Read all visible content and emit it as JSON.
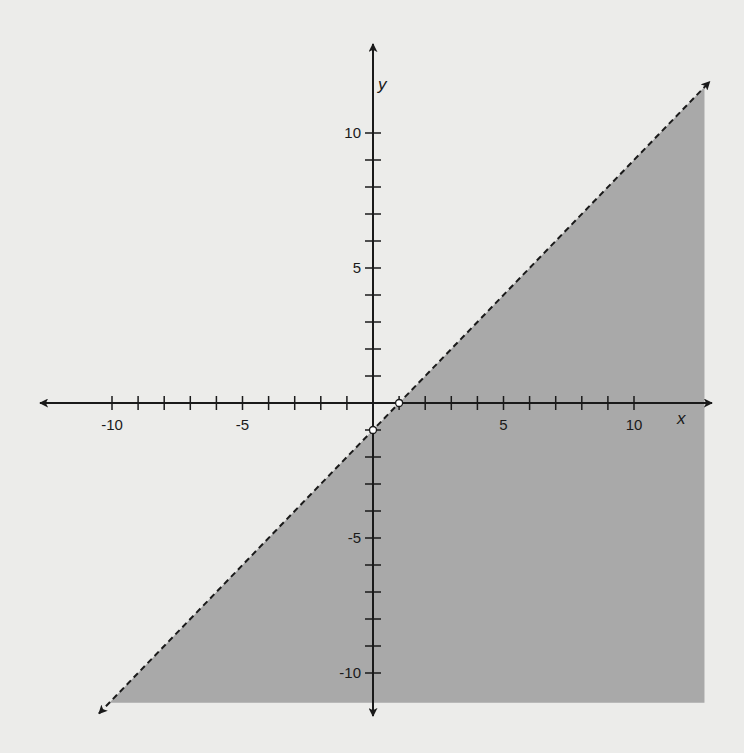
{
  "chart_data": {
    "type": "inequality-graph",
    "title": "",
    "xlabel": "x",
    "ylabel": "y",
    "xlim": [
      -12.5,
      12.8
    ],
    "ylim": [
      -11.8,
      13.3
    ],
    "x_ticks": [
      -10,
      -9,
      -8,
      -7,
      -6,
      -5,
      -4,
      -3,
      -2,
      -1,
      1,
      2,
      3,
      4,
      5,
      6,
      7,
      8,
      9,
      10
    ],
    "y_ticks": [
      -10,
      -9,
      -8,
      -7,
      -6,
      -5,
      -4,
      -3,
      -2,
      -1,
      1,
      2,
      3,
      4,
      5,
      6,
      7,
      8,
      9,
      10
    ],
    "x_tick_labels": [
      {
        "value": -10,
        "label": "-10"
      },
      {
        "value": -5,
        "label": "-5"
      },
      {
        "value": 5,
        "label": "5"
      },
      {
        "value": 10,
        "label": "10"
      }
    ],
    "y_tick_labels": [
      {
        "value": 10,
        "label": "10"
      },
      {
        "value": 5,
        "label": "5"
      },
      {
        "value": -5,
        "label": "-5"
      },
      {
        "value": -10,
        "label": "-10"
      }
    ],
    "boundary_line": {
      "equation": "y = x - 1",
      "slope": 1,
      "intercept": -1,
      "style": "dashed",
      "arrows": "both",
      "from": [
        -10.5,
        -11.5
      ],
      "to": [
        12.9,
        11.9
      ]
    },
    "shaded_region": {
      "inequality": "y < x - 1",
      "side": "below",
      "color": "#a9a9a9",
      "bounds": {
        "x_max": 12.7,
        "y_min": -11.1
      }
    },
    "marked_points": [
      {
        "x": 1,
        "y": 0,
        "style": "open-circle",
        "label": "x-intercept"
      },
      {
        "x": 0,
        "y": -1,
        "style": "open-circle",
        "label": "y-intercept"
      }
    ],
    "grid": false,
    "legend": null
  },
  "colors": {
    "background": "#ececea",
    "shade": "#a9a9a9",
    "ink": "#1a1a1a"
  }
}
